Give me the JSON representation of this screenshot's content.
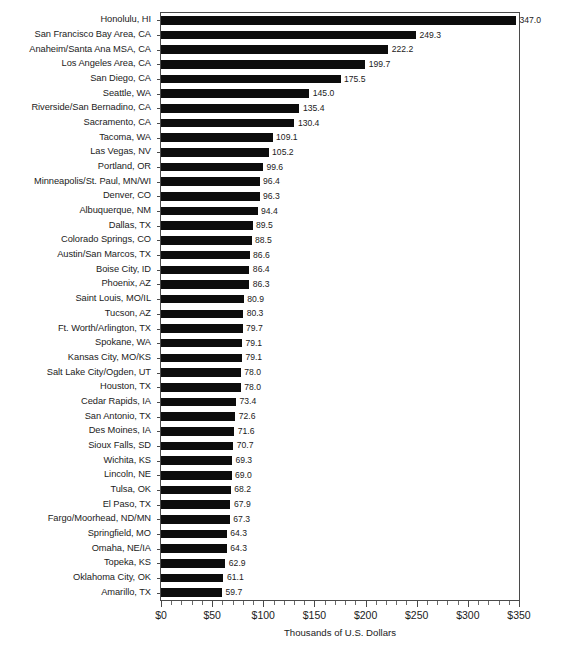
{
  "chart_data": {
    "type": "bar",
    "orientation": "horizontal",
    "title": "",
    "subtitle": "",
    "xlabel": "Thousands of U.S. Dollars",
    "ylabel": "",
    "xlim": [
      0,
      350
    ],
    "ylim": null,
    "grid": false,
    "legend": null,
    "legend_position": "none",
    "bar_color": "#0c0c0c",
    "axis_color": "#4a4a4a",
    "x_tick_labels": [
      "$0",
      "$50",
      "$100",
      "$150",
      "$200",
      "$250",
      "$300",
      "$350"
    ],
    "x_tick_values": [
      0,
      50,
      100,
      150,
      200,
      250,
      300,
      350
    ],
    "x_minor_tick_step": 10,
    "value_label_format": "one-decimal",
    "categories": [
      "Honolulu, HI",
      "San Francisco Bay Area, CA",
      "Anaheim/Santa Ana MSA, CA",
      "Los Angeles Area, CA",
      "San Diego, CA",
      "Seattle, WA",
      "Riverside/San Bernadino, CA",
      "Sacramento, CA",
      "Tacoma, WA",
      "Las Vegas, NV",
      "Portland, OR",
      "Minneapolis/St. Paul, MN/WI",
      "Denver, CO",
      "Albuquerque, NM",
      "Dallas, TX",
      "Colorado Springs, CO",
      "Austin/San Marcos, TX",
      "Boise City, ID",
      "Phoenix, AZ",
      "Saint Louis, MO/IL",
      "Tucson, AZ",
      "Ft. Worth/Arlington, TX",
      "Spokane, WA",
      "Kansas City, MO/KS",
      "Salt Lake City/Ogden, UT",
      "Houston, TX",
      "Cedar Rapids, IA",
      "San Antonio, TX",
      "Des Moines, IA",
      "Sioux Falls, SD",
      "Wichita, KS",
      "Lincoln, NE",
      "Tulsa, OK",
      "El Paso, TX",
      "Fargo/Moorhead, ND/MN",
      "Springfield, MO",
      "Omaha, NE/IA",
      "Topeka, KS",
      "Oklahoma City, OK",
      "Amarillo, TX"
    ],
    "values": [
      347.0,
      249.3,
      222.2,
      199.7,
      175.5,
      145.0,
      135.4,
      130.4,
      109.1,
      105.2,
      99.6,
      96.4,
      96.3,
      94.4,
      89.5,
      88.5,
      86.6,
      86.4,
      86.3,
      80.9,
      80.3,
      79.7,
      79.1,
      79.1,
      78.0,
      78.0,
      73.4,
      72.6,
      71.6,
      70.7,
      69.3,
      69.0,
      68.2,
      67.9,
      67.3,
      64.3,
      64.3,
      62.9,
      61.1,
      59.7
    ],
    "value_labels": [
      "347.0",
      "249.3",
      "222.2",
      "199.7",
      "175.5",
      "145.0",
      "135.4",
      "130.4",
      "109.1",
      "105.2",
      "99.6",
      "96.4",
      "96.3",
      "94.4",
      "89.5",
      "88.5",
      "86.6",
      "86.4",
      "86.3",
      "80.9",
      "80.3",
      "79.7",
      "79.1",
      "79.1",
      "78.0",
      "78.0",
      "73.4",
      "72.6",
      "71.6",
      "70.7",
      "69.3",
      "69.0",
      "68.2",
      "67.9",
      "67.3",
      "64.3",
      "64.3",
      "62.9",
      "61.1",
      "59.7"
    ]
  }
}
